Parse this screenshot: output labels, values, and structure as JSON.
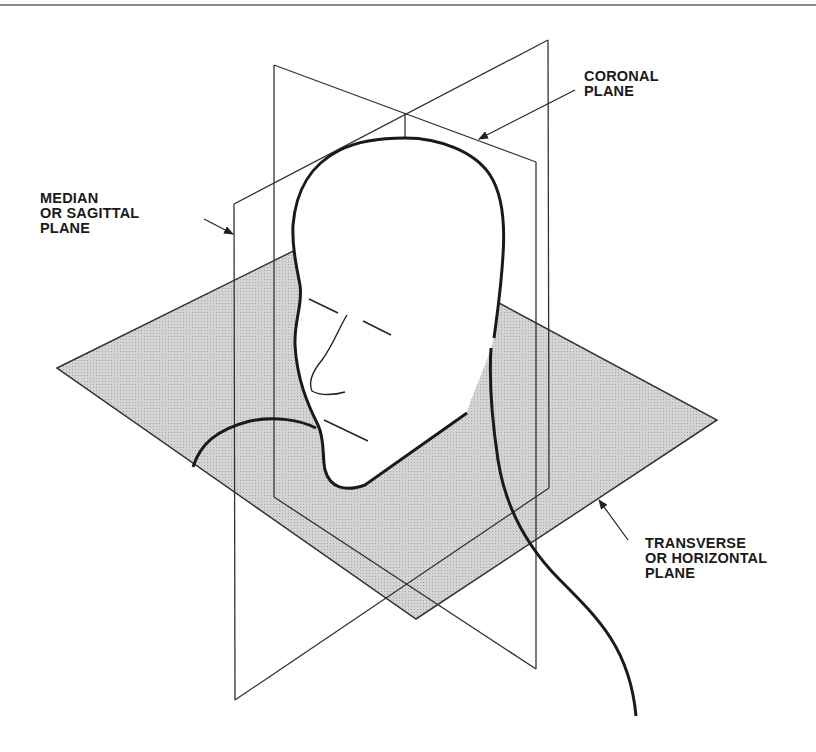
{
  "diagram": {
    "labels": {
      "coronal": [
        "CORONAL",
        "PLANE"
      ],
      "median": [
        "MEDIAN",
        "OR SAGITTAL",
        "PLANE"
      ],
      "transverse": [
        "TRANSVERSE",
        "OR HORIZONTAL",
        "PLANE"
      ]
    },
    "colors": {
      "plane_fill": "#c8c8c8",
      "line": "#222222",
      "background": "#ffffff"
    }
  }
}
